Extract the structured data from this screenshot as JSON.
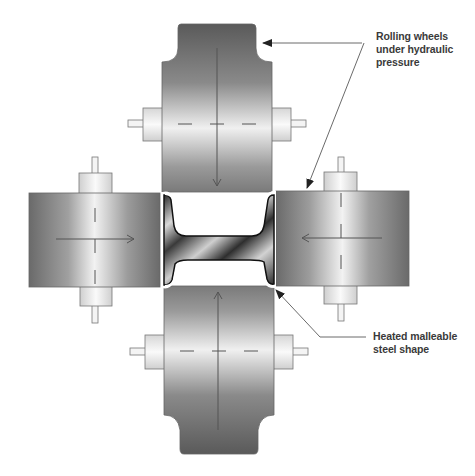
{
  "diagram": {
    "labels": {
      "rolling_wheels": {
        "lines": [
          "Rolling wheels",
          "under hydraulic",
          "pressure"
        ]
      },
      "steel_shape": {
        "lines": [
          "Heated malleable",
          "steel shape"
        ]
      }
    },
    "components": [
      {
        "name": "top-rolling-wheel",
        "motion": "down"
      },
      {
        "name": "bottom-rolling-wheel",
        "motion": "up"
      },
      {
        "name": "left-rolling-wheel",
        "motion": "right"
      },
      {
        "name": "right-rolling-wheel",
        "motion": "left"
      },
      {
        "name": "steel-i-beam",
        "motion": "none"
      }
    ],
    "colors": {
      "wheel_dark": "#5e5e5e",
      "wheel_light": "#ececec",
      "outline": "#555555",
      "background": "#ffffff",
      "text": "#3a3a3a"
    }
  }
}
